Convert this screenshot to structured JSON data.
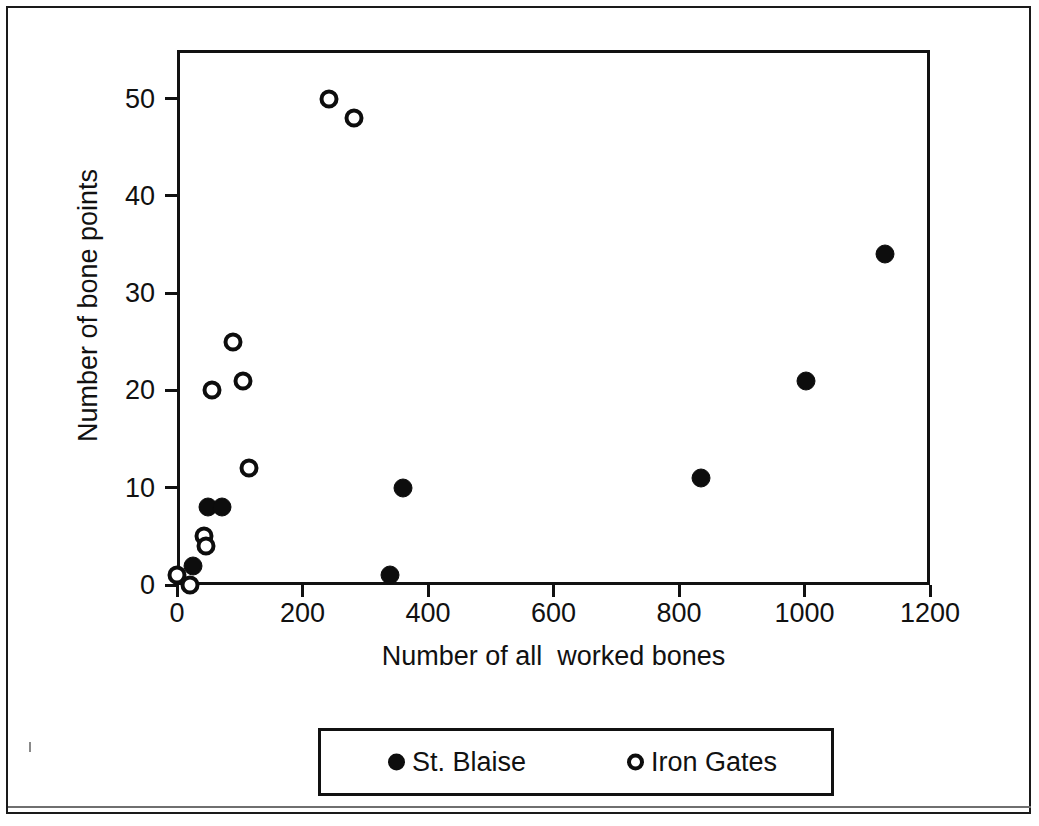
{
  "chart_data": {
    "type": "scatter",
    "title": "",
    "xlabel": "Number of all  worked bones",
    "ylabel": "Number of bone points",
    "xlim": [
      0,
      1200
    ],
    "ylim": [
      0,
      55
    ],
    "xticks": [
      0,
      200,
      400,
      600,
      800,
      1000,
      1200
    ],
    "yticks": [
      0,
      10,
      20,
      30,
      40,
      50
    ],
    "xticklabels": [
      "0",
      "200",
      "400",
      "600",
      "800",
      "1000",
      "1200"
    ],
    "yticklabels": [
      "0",
      "10",
      "20",
      "30",
      "40",
      "50"
    ],
    "grid": false,
    "legend_position": "below-plot",
    "series": [
      {
        "name": "St. Blaise",
        "marker": "filled-circle",
        "color": "#0d0d0d",
        "points": [
          {
            "x": 25,
            "y": 2
          },
          {
            "x": 50,
            "y": 8
          },
          {
            "x": 72,
            "y": 8
          },
          {
            "x": 340,
            "y": 1
          },
          {
            "x": 360,
            "y": 10
          },
          {
            "x": 835,
            "y": 11
          },
          {
            "x": 1002,
            "y": 21
          },
          {
            "x": 1128,
            "y": 34
          }
        ]
      },
      {
        "name": "Iron Gates",
        "marker": "open-circle",
        "color": "#0d0d0d",
        "points": [
          {
            "x": 0,
            "y": 1
          },
          {
            "x": 20,
            "y": 0
          },
          {
            "x": 43,
            "y": 5
          },
          {
            "x": 47,
            "y": 4
          },
          {
            "x": 55,
            "y": 20
          },
          {
            "x": 90,
            "y": 25
          },
          {
            "x": 105,
            "y": 21
          },
          {
            "x": 115,
            "y": 12
          },
          {
            "x": 243,
            "y": 50
          },
          {
            "x": 282,
            "y": 48
          }
        ]
      }
    ]
  },
  "legend": {
    "entries": [
      {
        "label": "St. Blaise",
        "marker": "filled-circle"
      },
      {
        "label": "Iron Gates",
        "marker": "open-circle"
      }
    ]
  }
}
